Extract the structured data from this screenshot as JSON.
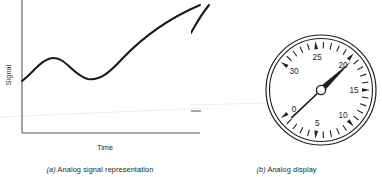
{
  "figure": {
    "panels": [
      {
        "id": "analog-signal-chart",
        "caption_index": "(a)",
        "caption_text": "Analog signal representation",
        "x_axis_label": "Time",
        "y_axis_label": "Signal"
      },
      {
        "id": "analog-display-gauge",
        "caption_index": "(b)",
        "caption_text": "Analog display"
      }
    ]
  },
  "chart_data": {
    "type": "line",
    "title": "",
    "xlabel": "Time",
    "ylabel": "Signal",
    "grid": false,
    "legend": null,
    "xlim": [
      0,
      1
    ],
    "ylim": [
      0,
      1
    ],
    "axis_ticks": {
      "x": [],
      "y": []
    },
    "series": [
      {
        "name": "Analog signal",
        "x": [
          0.0,
          0.06,
          0.12,
          0.18,
          0.24,
          0.3,
          0.36,
          0.43,
          0.5,
          0.58,
          0.66,
          0.74,
          0.82,
          0.9,
          1.0
        ],
        "y": [
          0.41,
          0.5,
          0.57,
          0.6,
          0.59,
          0.55,
          0.5,
          0.46,
          0.45,
          0.48,
          0.55,
          0.65,
          0.76,
          0.87,
          0.96
        ]
      }
    ],
    "annotations": [
      {
        "label": "local maximum",
        "x": 0.18,
        "y": 0.6
      },
      {
        "label": "local minimum",
        "x": 0.5,
        "y": 0.45
      }
    ]
  },
  "gauge_data": {
    "type": "gauge",
    "title": "Analog display",
    "min": 0,
    "max": 30,
    "major_tick_values": [
      0,
      5,
      10,
      15,
      20,
      25,
      30
    ],
    "major_tick_labels": [
      "0",
      "5",
      "10",
      "15",
      "20",
      "25",
      "30"
    ],
    "minor_tick_count_per_interval": 4,
    "needle_value": 19.5,
    "start_angle_deg": 215,
    "sweep_deg": 290,
    "colors": {
      "dial_face": "#ffffff",
      "rim": "#231f20",
      "tick": "#231f20",
      "needle": "#231f20",
      "hub_fill": "#ffffff"
    }
  },
  "colors": {
    "background": "#ffffff",
    "ink": "#231f20",
    "axis": "#58595b",
    "faint": "#ececed"
  }
}
